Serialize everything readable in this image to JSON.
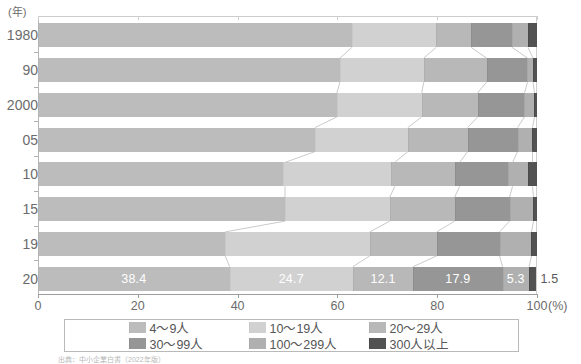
{
  "axis": {
    "y_unit_label": "(年)",
    "x_unit_label": "(%)",
    "x_ticks": [
      "0",
      "20",
      "40",
      "60",
      "80",
      "100"
    ],
    "x_min": 0,
    "x_max": 100
  },
  "legend": {
    "items": [
      {
        "label": "4〜9人",
        "color": "#b4b4b4"
      },
      {
        "label": "10〜19人",
        "color": "#c9c9c9"
      },
      {
        "label": "20〜29人",
        "color": "#b0b0b0"
      },
      {
        "label": "30〜99人",
        "color": "#8e8e8e"
      },
      {
        "label": "100〜299人",
        "color": "#a8a8a8"
      },
      {
        "label": "300人以上",
        "color": "#4a4a4a"
      }
    ]
  },
  "chart_data": {
    "type": "bar",
    "orientation": "horizontal",
    "stacked": true,
    "normalized_percent": true,
    "title": "",
    "xlabel": "(%)",
    "ylabel": "(年)",
    "xlim": [
      0,
      100
    ],
    "grid": false,
    "legend_position": "bottom",
    "categories": [
      "1980",
      "90",
      "2000",
      "05",
      "10",
      "15",
      "19",
      "20"
    ],
    "series": [
      {
        "name": "4〜9人",
        "values": [
          62.9,
          60.5,
          59.9,
          55.5,
          49.5,
          49.5,
          37.5,
          38.4
        ]
      },
      {
        "name": "10〜19人",
        "values": [
          16.9,
          16.8,
          17.0,
          18.6,
          22.0,
          21.0,
          29.0,
          24.7
        ]
      },
      {
        "name": "20〜29人",
        "values": [
          7.0,
          12.6,
          11.2,
          12.0,
          13.0,
          13.0,
          13.4,
          12.1
        ]
      },
      {
        "name": "30〜99人",
        "values": [
          8.2,
          8.2,
          9.4,
          10.0,
          10.6,
          11.0,
          12.6,
          17.9
        ]
      },
      {
        "name": "100〜299人",
        "values": [
          3.2,
          1.1,
          2.0,
          3.0,
          4.0,
          4.8,
          6.4,
          5.3
        ]
      },
      {
        "name": "300人以上",
        "values": [
          1.8,
          0.8,
          0.5,
          0.9,
          1.9,
          0.7,
          1.1,
          1.5
        ]
      }
    ],
    "data_labels": {
      "category": "20",
      "values": [
        "38.4",
        "24.7",
        "12.1",
        "17.9",
        "5.3",
        "1.5"
      ]
    }
  },
  "source_note": "出典：中小企業白書（2022年版）"
}
